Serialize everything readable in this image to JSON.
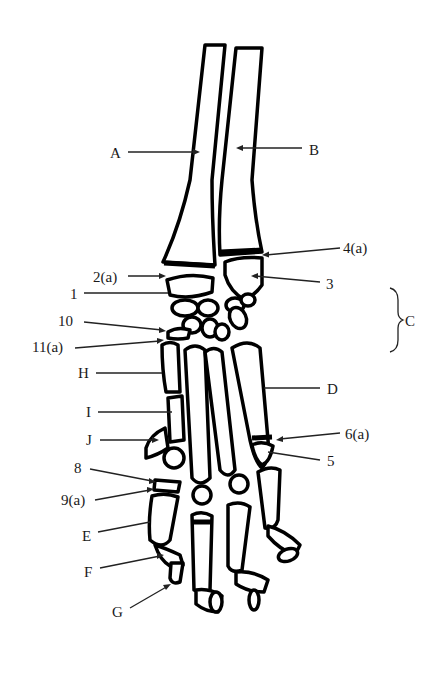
{
  "figure": {
    "type": "anatomical line drawing",
    "stroke_color": "#000000",
    "background": "#ffffff"
  },
  "labels": [
    {
      "id": "A",
      "text": "A",
      "x": 110,
      "y": 146
    },
    {
      "id": "B",
      "text": "B",
      "x": 309,
      "y": 143
    },
    {
      "id": "4a",
      "text": "4(a)",
      "x": 343,
      "y": 241
    },
    {
      "id": "2a",
      "text": "2(a)",
      "x": 93,
      "y": 272
    },
    {
      "id": "3",
      "text": "3",
      "x": 326,
      "y": 277
    },
    {
      "id": "1",
      "text": "1",
      "x": 70,
      "y": 288
    },
    {
      "id": "C",
      "text": "C",
      "x": 405,
      "y": 314
    },
    {
      "id": "10",
      "text": "10",
      "x": 58,
      "y": 315
    },
    {
      "id": "11a",
      "text": "11(a)",
      "x": 32,
      "y": 341
    },
    {
      "id": "H",
      "text": "H",
      "x": 78,
      "y": 366
    },
    {
      "id": "D",
      "text": "D",
      "x": 327,
      "y": 383
    },
    {
      "id": "I",
      "text": "I",
      "x": 86,
      "y": 405
    },
    {
      "id": "6a",
      "text": "6(a)",
      "x": 345,
      "y": 428
    },
    {
      "id": "J",
      "text": "J",
      "x": 86,
      "y": 433
    },
    {
      "id": "5",
      "text": "5",
      "x": 327,
      "y": 455
    },
    {
      "id": "8",
      "text": "8",
      "x": 74,
      "y": 462
    },
    {
      "id": "9a",
      "text": "9(a)",
      "x": 61,
      "y": 493
    },
    {
      "id": "E",
      "text": "E",
      "x": 82,
      "y": 530
    },
    {
      "id": "F",
      "text": "F",
      "x": 84,
      "y": 566
    },
    {
      "id": "G",
      "text": "G",
      "x": 112,
      "y": 606
    }
  ],
  "bracket": {
    "label": "C",
    "spans": "carpal bones"
  }
}
